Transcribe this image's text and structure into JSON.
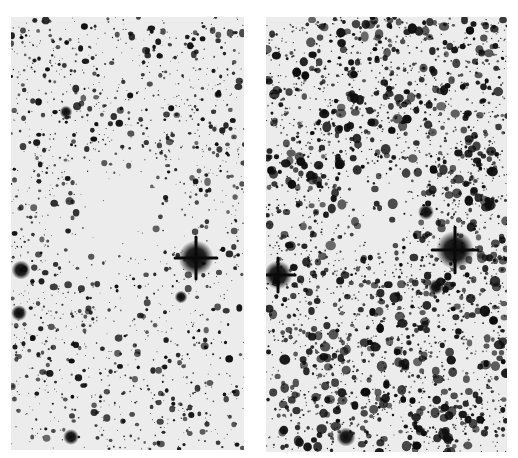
{
  "figure": {
    "background_color": "#ffffff",
    "star_color": "#0a0a0a",
    "sky_color": "#ececec"
  },
  "panels": [
    {
      "id": "left",
      "x": 11,
      "y": 17,
      "width": 233,
      "height": 433,
      "seed": 1337,
      "star_count": 1500,
      "size_scale": 1.0,
      "blur": 0.45,
      "nebula": {
        "cx": 105,
        "cy": 200,
        "rx": 70,
        "ry": 70,
        "strength": 0.93
      },
      "bright_stars": [
        {
          "x": 185,
          "y": 241,
          "r": 11
        },
        {
          "x": 10,
          "y": 253,
          "r": 6
        },
        {
          "x": 8,
          "y": 296,
          "r": 5
        },
        {
          "x": 60,
          "y": 420,
          "r": 5
        },
        {
          "x": 170,
          "y": 280,
          "r": 4
        },
        {
          "x": 55,
          "y": 95,
          "r": 4
        }
      ]
    },
    {
      "id": "right",
      "x": 266,
      "y": 17,
      "width": 241,
      "height": 435,
      "seed": 4242,
      "star_count": 2600,
      "size_scale": 1.35,
      "blur": 0.75,
      "nebula": {
        "cx": 112,
        "cy": 198,
        "rx": 62,
        "ry": 62,
        "strength": 0.85
      },
      "bright_stars": [
        {
          "x": 189,
          "y": 233,
          "r": 12
        },
        {
          "x": 12,
          "y": 258,
          "r": 9
        },
        {
          "x": 160,
          "y": 195,
          "r": 5
        },
        {
          "x": 80,
          "y": 420,
          "r": 6
        },
        {
          "x": 170,
          "y": 270,
          "r": 5
        }
      ]
    }
  ]
}
